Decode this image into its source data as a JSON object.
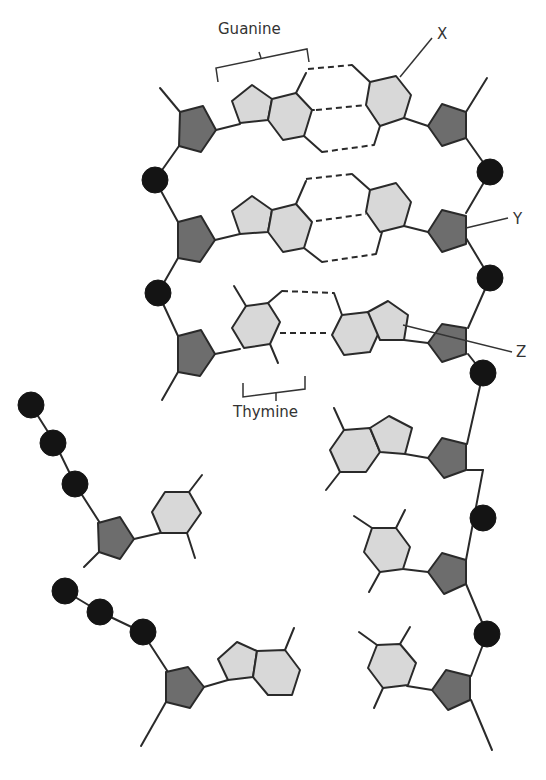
{
  "diagram": {
    "colors": {
      "phosphate": "#141414",
      "sugar": "#6d6d6d",
      "base": "#d8d8d8",
      "outline": "#2a2a2a",
      "background": "#ffffff"
    },
    "labels": {
      "guanine": "Guanine",
      "thymine": "Thymine",
      "x": "X",
      "y": "Y",
      "z": "Z"
    },
    "legend_meaning": {
      "phosphate": "black circle",
      "sugar": "dark grey pentagon",
      "base": "light grey hexagon / pentagon rings"
    }
  }
}
